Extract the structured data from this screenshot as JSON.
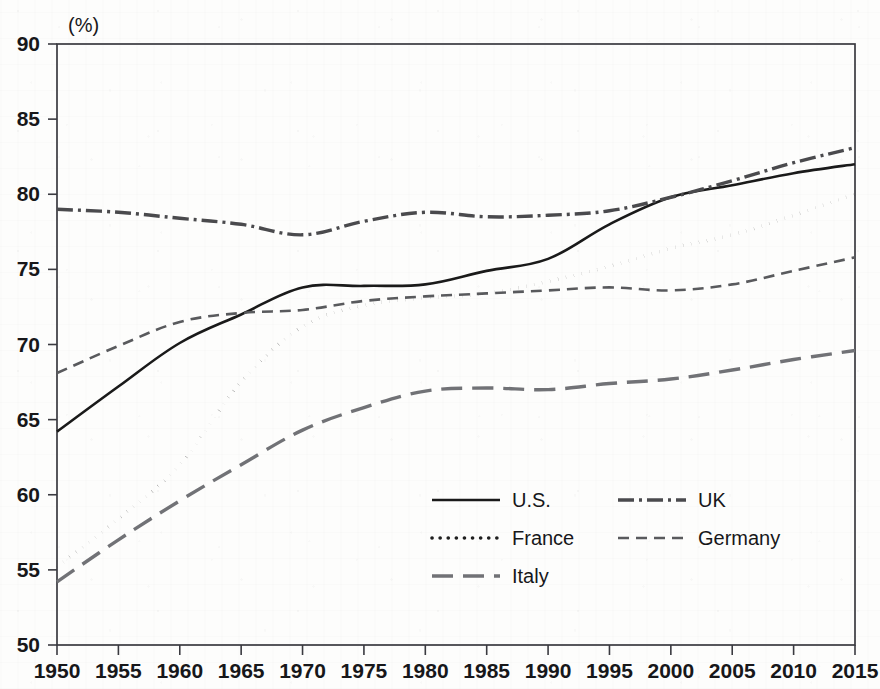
{
  "chart_data": {
    "type": "line",
    "title": "",
    "xlabel": "",
    "ylabel": "",
    "unit_label": "(%)",
    "xlim": [
      1950,
      2015
    ],
    "ylim": [
      50,
      90
    ],
    "ytick_labels": [
      "50",
      "55",
      "60",
      "65",
      "70",
      "75",
      "80",
      "85",
      "90"
    ],
    "ytick_values": [
      50,
      55,
      60,
      65,
      70,
      75,
      80,
      85,
      90
    ],
    "xtick_labels": [
      "1950",
      "1955",
      "1960",
      "1965",
      "1970",
      "1975",
      "1980",
      "1985",
      "1990",
      "1995",
      "2000",
      "2005",
      "2010",
      "2015"
    ],
    "xtick_values": [
      1950,
      1955,
      1960,
      1965,
      1970,
      1975,
      1980,
      1985,
      1990,
      1995,
      2000,
      2005,
      2010,
      2015
    ],
    "grid": false,
    "legend_position": "lower-center",
    "x": [
      1950,
      1955,
      1960,
      1965,
      1970,
      1975,
      1980,
      1985,
      1990,
      1995,
      2000,
      2005,
      2010,
      2015
    ],
    "series": [
      {
        "name": "U.S.",
        "style": "solid",
        "color": "#1a1a1a",
        "values": [
          64.2,
          67.2,
          70.1,
          72.0,
          73.8,
          73.9,
          74.0,
          74.9,
          75.7,
          78.0,
          79.8,
          80.6,
          81.4,
          82.0
        ]
      },
      {
        "name": "UK",
        "style": "dash-dot",
        "color": "#4a4a4d",
        "values": [
          79.0,
          78.8,
          78.4,
          78.0,
          77.3,
          78.2,
          78.8,
          78.5,
          78.6,
          78.9,
          79.8,
          80.9,
          82.1,
          83.1
        ]
      },
      {
        "name": "France",
        "style": "dotted",
        "color": "#1f1f1f",
        "values": [
          55.2,
          58.4,
          62.0,
          67.5,
          71.2,
          72.6,
          73.1,
          73.4,
          74.2,
          75.2,
          76.4,
          77.3,
          78.6,
          80.0
        ]
      },
      {
        "name": "Germany",
        "style": "dashed",
        "color": "#595a5d",
        "values": [
          68.1,
          69.9,
          71.5,
          72.1,
          72.3,
          72.9,
          73.2,
          73.4,
          73.6,
          73.8,
          73.6,
          74.0,
          74.9,
          75.8
        ]
      },
      {
        "name": "Italy",
        "style": "long-dash",
        "color": "#717276",
        "values": [
          54.2,
          57.0,
          59.6,
          62.0,
          64.3,
          65.8,
          66.9,
          67.1,
          67.0,
          67.4,
          67.7,
          68.3,
          69.0,
          69.6
        ]
      }
    ],
    "legend_entries": [
      {
        "label": "U.S.",
        "style": "solid"
      },
      {
        "label": "UK",
        "style": "dash-dot"
      },
      {
        "label": "France",
        "style": "dotted"
      },
      {
        "label": "Germany",
        "style": "dashed"
      },
      {
        "label": "Italy",
        "style": "long-dash"
      }
    ]
  }
}
